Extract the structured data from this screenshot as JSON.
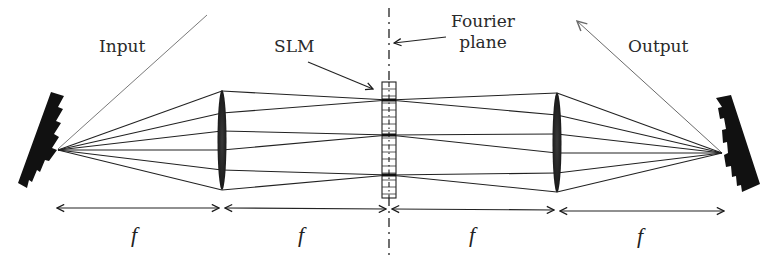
{
  "diagram": {
    "labels": {
      "input": "Input",
      "output": "Output",
      "slm": "SLM",
      "fourier_line1": "Fourier",
      "fourier_line2": "plane"
    },
    "distances": [
      {
        "label": "f",
        "from_x": 57,
        "to_x": 220
      },
      {
        "label": "f",
        "from_x": 224,
        "to_x": 388
      },
      {
        "label": "f",
        "from_x": 392,
        "to_x": 553
      },
      {
        "label": "f",
        "from_x": 557,
        "to_x": 724
      }
    ],
    "components": [
      {
        "name": "input-grating",
        "type": "diffraction grating",
        "focus": [
          58,
          150
        ]
      },
      {
        "name": "lens-1",
        "type": "lens",
        "x": 222,
        "y_top": 90,
        "y_bottom": 190
      },
      {
        "name": "slm",
        "type": "spatial light modulator",
        "x": 389,
        "y_top": 82,
        "y_bottom": 200
      },
      {
        "name": "lens-2",
        "type": "lens",
        "x": 557,
        "y_top": 93,
        "y_bottom": 192
      },
      {
        "name": "output-grating",
        "type": "diffraction grating",
        "focus": [
          722,
          153
        ]
      }
    ],
    "colors": {
      "ink": "#1a1a1a",
      "beam_line": "#7a7a7a",
      "background": "#ffffff"
    }
  }
}
